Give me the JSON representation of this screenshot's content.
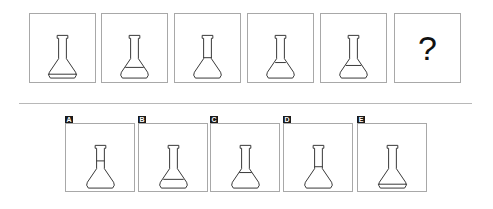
{
  "puzzle": {
    "sequence": [
      {
        "id": "1",
        "fill_level": "base"
      },
      {
        "id": "2",
        "fill_level": "low"
      },
      {
        "id": "3",
        "fill_level": "neck"
      },
      {
        "id": "4",
        "fill_level": "shoulder"
      },
      {
        "id": "5",
        "fill_level": "mid"
      }
    ],
    "question_mark": "?"
  },
  "options": [
    {
      "label": "A",
      "fill_level": "neck-high"
    },
    {
      "label": "B",
      "fill_level": "low"
    },
    {
      "label": "C",
      "fill_level": "shoulder"
    },
    {
      "label": "D",
      "fill_level": "neck"
    },
    {
      "label": "E",
      "fill_level": "base"
    }
  ],
  "colors": {
    "border": "#a8a8a8",
    "stroke": "#333333",
    "label_bg": "#1a1a1a",
    "divider": "#b8b8b8"
  }
}
